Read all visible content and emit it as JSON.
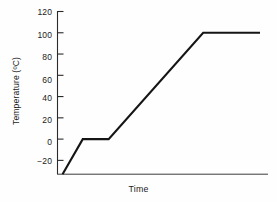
{
  "chart_data": {
    "type": "line",
    "title": "",
    "xlabel": "Time",
    "ylabel": "Temperature (ºC)",
    "ylim": [
      -33,
      120
    ],
    "xlim": [
      0,
      100
    ],
    "grid": false,
    "legend": null,
    "y_ticks": [
      120,
      100,
      80,
      60,
      40,
      20,
      0,
      -20
    ],
    "y_tick_labels": [
      "120",
      "100",
      "80",
      "60",
      "40",
      "20",
      "0",
      "−20"
    ],
    "x_ticks": [],
    "x_tick_labels": [],
    "axes": {
      "left_spine": true,
      "bottom_spine": true,
      "top_spine": false,
      "right_spine": false,
      "tick_direction": "out"
    },
    "series": [
      {
        "name": "heating curve",
        "color": "#151515",
        "line_width": 2.1,
        "points": [
          {
            "x": 2.4,
            "y": -33
          },
          {
            "x": 12.0,
            "y": 0
          },
          {
            "x": 24.3,
            "y": 0
          },
          {
            "x": 69.2,
            "y": 100
          },
          {
            "x": 96.2,
            "y": 100
          }
        ]
      }
    ],
    "annotations": []
  },
  "colors": {
    "background": "#fefefe",
    "axis": "#2a2a2a",
    "text": "#1a1a1a",
    "line": "#151515"
  }
}
